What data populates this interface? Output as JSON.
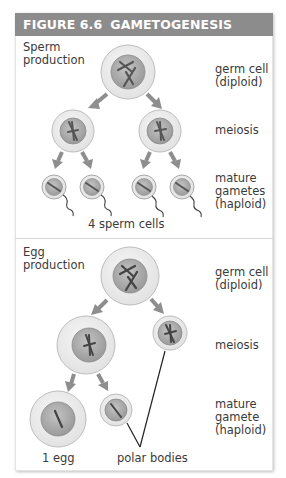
{
  "figure": {
    "number": "FIGURE 6.6",
    "title": "GAMETOGENESIS",
    "header_color": "#8c8c8c"
  },
  "sperm": {
    "section_label_line1": "Sperm",
    "section_label_line2": "production",
    "stage_labels": {
      "germ_line1": "germ cell",
      "germ_line2": "(diploid)",
      "meiosis": "meiosis",
      "mature_line1": "mature",
      "mature_line2": "gametes",
      "mature_line3": "(haploid)"
    },
    "caption": "4 sperm cells"
  },
  "egg": {
    "section_label_line1": "Egg",
    "section_label_line2": "production",
    "stage_labels": {
      "germ_line1": "germ cell",
      "germ_line2": "(diploid)",
      "meiosis": "meiosis",
      "mature_line1": "mature",
      "mature_line2": "gamete",
      "mature_line3": "(haploid)"
    },
    "caption_egg": "1 egg",
    "caption_polar": "polar bodies"
  }
}
